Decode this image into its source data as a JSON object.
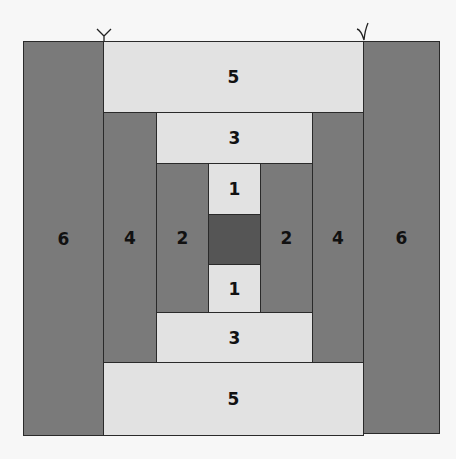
{
  "diagram": {
    "type": "quilt-block-courthouse-steps",
    "colors": {
      "dark": "#7a7a7a",
      "light": "#e2e2e2",
      "center": "#555555",
      "border": "#2a2a2a"
    },
    "pieces": {
      "left_6": "6",
      "right_6": "6",
      "top_5": "5",
      "bottom_5": "5",
      "left_4": "4",
      "right_4": "4",
      "top_3": "3",
      "bottom_3": "3",
      "left_2": "2",
      "right_2": "2",
      "top_1": "1",
      "bottom_1": "1",
      "center": ""
    },
    "marks": [
      "thread-mark-left",
      "thread-mark-right"
    ]
  }
}
